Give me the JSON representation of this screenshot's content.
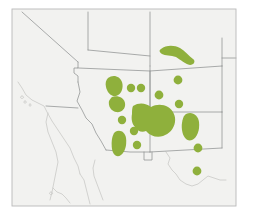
{
  "figure": {
    "kind": "distribution-map",
    "region": "Southwestern United States and northern Mexico",
    "title": "",
    "caption": "",
    "legend": "",
    "background_color": "#ffffff",
    "paper_color": "#f2f2f0",
    "frame_color": "#b9b9b9",
    "border_line_color": "#8f9191",
    "coastline_color": "#c9c9c7",
    "range_color": "#8fb03c"
  },
  "map": {
    "frame": {
      "x": 12,
      "y": 9,
      "width": 224,
      "height": 197
    },
    "paper_rect": {
      "x": 12,
      "y": 9,
      "width": 224,
      "height": 197
    },
    "political_boundaries": [
      {
        "name": "california-nevada-diagonal",
        "path": "M 22 12 L 78 62"
      },
      {
        "name": "nevada-east-border",
        "path": "M 78 62 L 78 68 L 74 68 L 74 73 L 78 76 L 78 82"
      },
      {
        "name": "nevada-arizona-colorado-river",
        "path": "M 78 82 L 80 92 L 77 101 L 82 110 L 86 118 L 92 124 L 96 133 L 101 141 L 106 150"
      },
      {
        "name": "oregon-idaho-nevada-top",
        "path": "M 88 12 L 88 50"
      },
      {
        "name": "idaho-wyoming-utah",
        "path": "M 150 12 L 150 66"
      },
      {
        "name": "utah-nevada-north",
        "path": "M 88 50 L 150 56"
      },
      {
        "name": "utah-colorado-border",
        "path": "M 150 66 L 150 112"
      },
      {
        "name": "utah-arizona-new-mexico-latitude",
        "path": "M 78 68 L 150 71 L 222 66"
      },
      {
        "name": "colorado-newmexico-latitude",
        "path": "M 150 112 L 222 112"
      },
      {
        "name": "wyoming-colorado-east",
        "path": "M 222 38 L 222 66"
      },
      {
        "name": "colorado-east-border",
        "path": "M 222 66 L 222 112"
      },
      {
        "name": "new-mexico-east-border",
        "path": "M 222 112 L 222 148"
      },
      {
        "name": "new-mexico-south-border",
        "path": "M 150 152 L 222 148"
      },
      {
        "name": "arizona-new-mexico-border",
        "path": "M 150 71 L 150 152"
      },
      {
        "name": "arizona-south-border",
        "path": "M 106 150 L 130 152 L 150 152"
      },
      {
        "name": "new-mexico-bootheel",
        "path": "M 144 152 L 144 160 L 152 160 L 152 152"
      },
      {
        "name": "california-arizona-south",
        "path": "M 46 106 L 78 108"
      },
      {
        "name": "colorado-utah-crossbar",
        "path": "M 222 58 L 236 58"
      }
    ],
    "coastlines": [
      {
        "name": "california-pacific-coast",
        "path": "M 18 82 L 22 88 L 26 95 L 32 100 L 38 103 L 44 106 L 47 112 L 52 121 L 58 130 L 64 139 L 70 148 L 74 158 L 78 166 L 80 174"
      },
      {
        "name": "channel-islands",
        "path": "M 22 96 m 0 0 a 1.6 1.2 0 1 0 0.1 0 M 25 101 a 1.4 1 0 1 0 0.1 0 M 30 104 a 1.2 1 0 1 0 0.1 0"
      },
      {
        "name": "baja-california-west-coast",
        "path": "M 48 113 L 46 122 L 48 132 L 52 142 L 56 152 L 58 162 L 56 172 L 54 182 L 52 192 L 50 200"
      },
      {
        "name": "gulf-of-california-east",
        "path": "M 80 174 L 84 180 L 86 188 L 88 196 L 90 204"
      },
      {
        "name": "baja-inner-gulf-coast",
        "path": "M 53 188 L 57 192 L 62 194 L 66 198 L 70 203"
      },
      {
        "name": "baja-small-island",
        "path": "M 51 192 a 1.6 1.3 0 1 0 0.1 0"
      },
      {
        "name": "sonora-coast",
        "path": "M 95 160 L 93 168 L 94 176 L 97 184 L 100 192 L 103 200"
      },
      {
        "name": "rio-grande-texas-mexico-border",
        "path": "M 166 152 L 170 158 L 168 164 L 172 170 L 176 174 L 180 180 L 186 184 L 192 186 L 198 184 L 203 180 L 208 176 L 214 178 L 220 180 L 226 180"
      }
    ],
    "range_patches": [
      {
        "name": "colorado-plateau-boomerang",
        "type": "blob",
        "path": "M 161 49 C 166 45, 174 45, 180 48 C 185 51, 189 56, 193 59 C 196 61, 194 65, 190 65 C 185 64, 181 60, 176 57 C 171 55, 165 56, 162 54 C 159 52, 159 50, 161 49 Z"
      },
      {
        "name": "southwest-utah-oval",
        "type": "blob",
        "path": "M 108 78 C 113 74, 120 76, 122 82 C 124 88, 121 95, 116 96 C 111 97, 107 92, 106 87 C 105 83, 106 80, 108 78 Z"
      },
      {
        "name": "north-central-arizona-oval",
        "type": "blob",
        "path": "M 112 97 C 118 95, 124 98, 125 103 C 126 109, 121 113, 116 112 C 111 111, 108 106, 109 101 C 110 99, 111 98, 112 97 Z"
      },
      {
        "name": "central-large-patch",
        "type": "blob",
        "path": "M 133 106 C 139 102, 146 103, 151 107 C 156 104, 163 104, 168 107 C 173 110, 176 116, 175 122 C 174 129, 169 134, 163 136 C 157 138, 150 136, 146 131 C 142 133, 137 131, 135 127 C 132 124, 131 119, 132 114 C 132 111, 132 108, 133 106 Z"
      },
      {
        "name": "southwest-arizona-patch",
        "type": "blob",
        "path": "M 115 132 C 120 129, 125 132, 126 138 C 127 145, 125 152, 121 155 C 117 158, 113 155, 112 149 C 111 142, 112 135, 115 132 Z"
      },
      {
        "name": "east-new-mexico-oval",
        "type": "blob",
        "path": "M 186 114 C 192 111, 198 115, 199 122 C 200 130, 197 138, 192 140 C 187 142, 183 137, 182 130 C 181 123, 183 116, 186 114 Z"
      },
      {
        "name": "dot-north-arizona-1",
        "type": "dot",
        "cx": 131,
        "cy": 88,
        "r": 4.2
      },
      {
        "name": "dot-north-arizona-2",
        "type": "dot",
        "cx": 141,
        "cy": 88,
        "r": 4.2
      },
      {
        "name": "dot-north-newmexico-1",
        "type": "dot",
        "cx": 159,
        "cy": 95,
        "r": 4.4
      },
      {
        "name": "dot-colorado-south",
        "type": "dot",
        "cx": 178,
        "cy": 80,
        "r": 4.4
      },
      {
        "name": "dot-east-newmexico-north",
        "type": "dot",
        "cx": 179,
        "cy": 104,
        "r": 4.2
      },
      {
        "name": "dot-west-arizona",
        "type": "dot",
        "cx": 122,
        "cy": 120,
        "r": 4.2
      },
      {
        "name": "dot-central-arizona-south",
        "type": "dot",
        "cx": 134,
        "cy": 131,
        "r": 4.2
      },
      {
        "name": "dot-south-arizona",
        "type": "dot",
        "cx": 137,
        "cy": 145,
        "r": 4.2
      },
      {
        "name": "dot-southeast-newmexico",
        "type": "dot",
        "cx": 198,
        "cy": 148,
        "r": 4.4
      },
      {
        "name": "dot-west-texas",
        "type": "dot",
        "cx": 197,
        "cy": 171,
        "r": 4.4
      }
    ]
  }
}
